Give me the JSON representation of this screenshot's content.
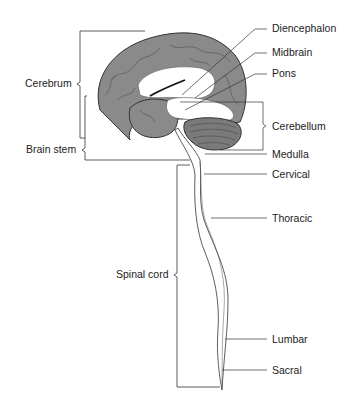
{
  "colors": {
    "cortex": "#8a8a8a",
    "white_matter": "#ffffff",
    "cerebellum": "#7a7a7a",
    "line": "#222222"
  },
  "left_labels": {
    "cerebrum": "Cerebrum",
    "brain_stem": "Brain stem",
    "spinal_cord": "Spinal cord"
  },
  "right_labels": {
    "diencephalon": "Diencephalon",
    "midbrain": "Midbrain",
    "pons": "Pons",
    "cerebellum": "Cerebellum",
    "medulla": "Medulla",
    "cervical": "Cervical",
    "thoracic": "Thoracic",
    "lumbar": "Lumbar",
    "sacral": "Sacral"
  }
}
